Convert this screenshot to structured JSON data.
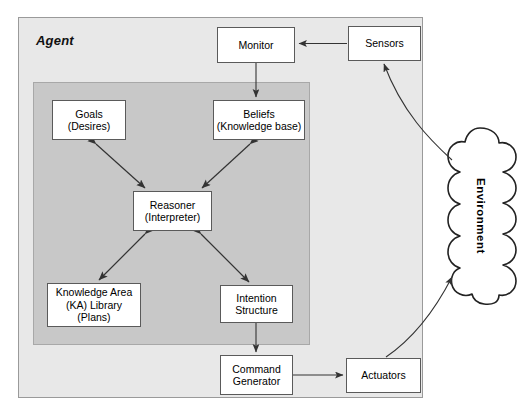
{
  "diagram": {
    "title": "Agent",
    "agent_label": "Agent",
    "environment_label": "Environment",
    "colors": {
      "page_background": "#ffffff",
      "agent_frame_fill": "#e8e8e8",
      "inner_panel_fill": "#c8c8c8",
      "node_fill": "#ffffff",
      "node_stroke": "#5a5a5a",
      "arrow_stroke": "#333333"
    },
    "nodes": [
      {
        "id": "monitor",
        "lines": [
          "Monitor"
        ]
      },
      {
        "id": "sensors",
        "lines": [
          "Sensors"
        ]
      },
      {
        "id": "goals",
        "lines": [
          "Goals",
          "(Desires)"
        ]
      },
      {
        "id": "beliefs",
        "lines": [
          "Beliefs",
          "(Knowledge base)"
        ]
      },
      {
        "id": "reasoner",
        "lines": [
          "Reasoner",
          "(Interpreter)"
        ]
      },
      {
        "id": "ka",
        "lines": [
          "Knowledge Area",
          "(KA) Library",
          "(Plans)"
        ]
      },
      {
        "id": "intention",
        "lines": [
          "Intention",
          "Structure"
        ]
      },
      {
        "id": "command",
        "lines": [
          "Command",
          "Generator"
        ]
      },
      {
        "id": "actuators",
        "lines": [
          "Actuators"
        ]
      }
    ],
    "connections": [
      {
        "from": "sensors",
        "to": "monitor",
        "style": "straight",
        "heads": "one"
      },
      {
        "from": "monitor",
        "to": "beliefs",
        "style": "straight",
        "heads": "one"
      },
      {
        "from": "goals",
        "to": "reasoner",
        "style": "straight",
        "heads": "both"
      },
      {
        "from": "beliefs",
        "to": "reasoner",
        "style": "straight",
        "heads": "both"
      },
      {
        "from": "reasoner",
        "to": "ka",
        "style": "straight",
        "heads": "both"
      },
      {
        "from": "reasoner",
        "to": "intention",
        "style": "straight",
        "heads": "both"
      },
      {
        "from": "intention",
        "to": "command",
        "style": "straight",
        "heads": "one"
      },
      {
        "from": "command",
        "to": "actuators",
        "style": "straight",
        "heads": "one"
      },
      {
        "from": "environment",
        "to": "sensors",
        "style": "curved",
        "heads": "one"
      },
      {
        "from": "actuators",
        "to": "environment",
        "style": "curved",
        "heads": "one"
      }
    ]
  }
}
